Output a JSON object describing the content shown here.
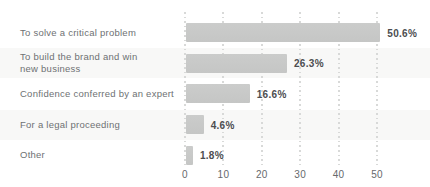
{
  "chart_data": {
    "type": "bar",
    "orientation": "horizontal",
    "title": "",
    "xlabel": "",
    "ylabel": "",
    "categories": [
      "To solve a critical problem",
      "To build the brand and win new business",
      "Confidence conferred by an expert",
      "For a legal proceeding",
      "Other"
    ],
    "category_label_lines": [
      [
        "To solve a critical problem"
      ],
      [
        "To build the brand and win",
        "new business"
      ],
      [
        "Confidence conferred by an expert"
      ],
      [
        "For a legal proceeding"
      ],
      [
        "Other"
      ]
    ],
    "values": [
      50.6,
      26.3,
      16.6,
      4.6,
      1.8
    ],
    "value_labels": [
      "50.6%",
      "26.3%",
      "16.6%",
      "4.6%",
      "1.8%"
    ],
    "xlim": [
      0,
      55
    ],
    "x_ticks": [
      "0",
      "10",
      "20",
      "30",
      "40",
      "50"
    ],
    "x_tick_values": [
      0,
      10,
      20,
      30,
      40,
      50
    ],
    "grid": "vertical-dotted",
    "legend": "none",
    "colors": {
      "bar": "#c8c9c8",
      "category_label": "#6e7173",
      "value_label": "#4c4d50",
      "tick_label": "#66696c",
      "gridline": "#d8d9d8",
      "row_band": "#f8f8f7",
      "background": "#ffffff"
    }
  }
}
